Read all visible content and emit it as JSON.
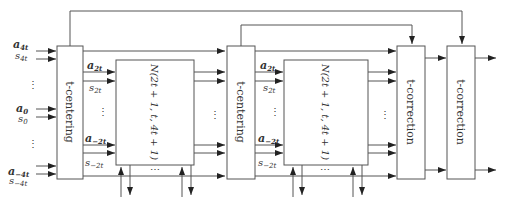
{
  "diagram": {
    "blocks": [
      {
        "id": "t-centering-1",
        "label": "t-centering"
      },
      {
        "id": "network-1",
        "label": "N(2t + 1, t, 4t + 1)"
      },
      {
        "id": "t-centering-2",
        "label": "t-centering"
      },
      {
        "id": "network-2",
        "label": "N(2t + 1, t, 4t + 1)"
      },
      {
        "id": "t-correction-1",
        "label": "t-correction"
      },
      {
        "id": "t-correction-2",
        "label": "t-correction"
      }
    ],
    "inputs": [
      {
        "a": "a",
        "a_sub": "4t",
        "s": "s",
        "s_sub": "4t"
      },
      {
        "a": "a",
        "a_sub": "0",
        "s": "s",
        "s_sub": "0"
      },
      {
        "a": "a",
        "a_sub": "−4t",
        "s": "s",
        "s_sub": "−4t"
      }
    ],
    "inner_inputs": [
      {
        "a": "a",
        "a_sub": "2t",
        "s": "s",
        "s_sub": "2t"
      },
      {
        "a": "a",
        "a_sub": "−2t",
        "s": "s",
        "s_sub": "−2t"
      }
    ],
    "ellipsis": "⋮",
    "h_ellipsis": "⋯"
  }
}
